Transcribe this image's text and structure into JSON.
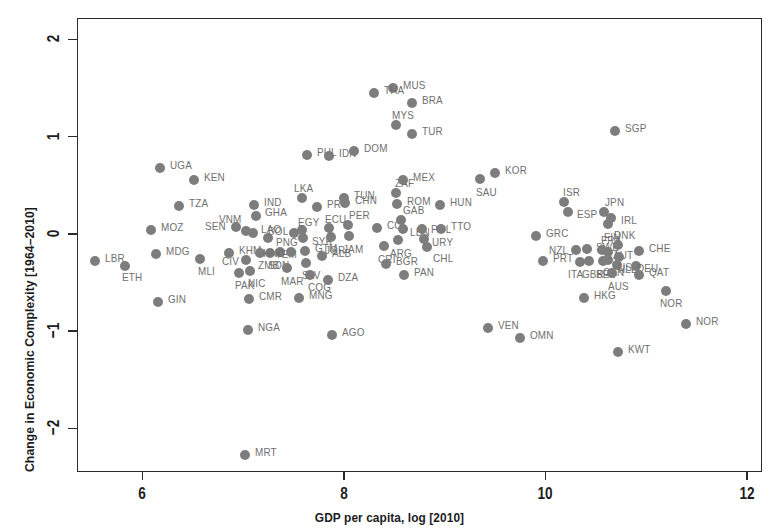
{
  "figure": {
    "background_color": "#ffffff",
    "point_color": "#7d7d7d",
    "label_color": "#6f6f6f",
    "axis_color": "#2a2a2a"
  },
  "chart_data": {
    "type": "scatter",
    "title": "",
    "subtitle": "",
    "xlabel": "GDP per capita, log [2010]",
    "ylabel": "Change in Economic Complexity [1964–2010]",
    "xlim": [
      5.35,
      12.15
    ],
    "ylim": [
      -2.45,
      2.22
    ],
    "xticks": [
      6,
      8,
      10,
      12
    ],
    "xtick_labels": [
      "6",
      "8",
      "10",
      "12"
    ],
    "yticks": [
      -2,
      -1,
      0,
      1,
      2
    ],
    "ytick_labels": [
      "−2",
      "−1",
      "0",
      "1",
      "2"
    ],
    "grid": false,
    "legend": false,
    "point_label_field": "iso3",
    "points": [
      {
        "iso3": "LBR",
        "x": 5.53,
        "y": -0.28,
        "lx": 10,
        "ly": -4
      },
      {
        "iso3": "ETH",
        "x": 5.83,
        "y": -0.33,
        "lx": -3,
        "ly": 10
      },
      {
        "iso3": "MOZ",
        "x": 6.08,
        "y": 0.04,
        "lx": 10,
        "ly": -4
      },
      {
        "iso3": "MDG",
        "x": 6.13,
        "y": -0.21,
        "lx": 10,
        "ly": -4
      },
      {
        "iso3": "UGA",
        "x": 6.17,
        "y": 0.68,
        "lx": 10,
        "ly": -4
      },
      {
        "iso3": "GIN",
        "x": 6.15,
        "y": -0.7,
        "lx": 10,
        "ly": -4
      },
      {
        "iso3": "TZA",
        "x": 6.36,
        "y": 0.29,
        "lx": 10,
        "ly": -4
      },
      {
        "iso3": "KEN",
        "x": 6.51,
        "y": 0.55,
        "lx": 10,
        "ly": -4
      },
      {
        "iso3": "MLI",
        "x": 6.57,
        "y": -0.26,
        "lx": -2,
        "ly": 11
      },
      {
        "iso3": "SEN",
        "x": 6.93,
        "y": 0.07,
        "lx": -31,
        "ly": -2
      },
      {
        "iso3": "KHM",
        "x": 6.86,
        "y": -0.2,
        "lx": 10,
        "ly": -4
      },
      {
        "iso3": "PAK",
        "x": 6.96,
        "y": -0.4,
        "lx": -4,
        "ly": 11
      },
      {
        "iso3": "VNM",
        "x": 7.03,
        "y": 0.03,
        "lx": -27,
        "ly": -13
      },
      {
        "iso3": "CIV",
        "x": 7.03,
        "y": -0.27,
        "lx": -24,
        "ly": 0
      },
      {
        "iso3": "NIC",
        "x": 7.07,
        "y": -0.38,
        "lx": -2,
        "ly": 11
      },
      {
        "iso3": "CMR",
        "x": 7.06,
        "y": -0.67,
        "lx": 10,
        "ly": -4
      },
      {
        "iso3": "MRT",
        "x": 7.02,
        "y": -2.27,
        "lx": 10,
        "ly": -4
      },
      {
        "iso3": "NGA",
        "x": 7.05,
        "y": -0.99,
        "lx": 10,
        "ly": -4
      },
      {
        "iso3": "IND",
        "x": 7.11,
        "y": 0.3,
        "lx": 10,
        "ly": -4
      },
      {
        "iso3": "GHA",
        "x": 7.13,
        "y": 0.18,
        "lx": 9,
        "ly": -5
      },
      {
        "iso3": "LAO",
        "x": 7.1,
        "y": 0.01,
        "lx": 8,
        "ly": -5
      },
      {
        "iso3": "ZMB",
        "x": 7.17,
        "y": -0.2,
        "lx": -2,
        "ly": 11
      },
      {
        "iso3": "SDN",
        "x": 7.27,
        "y": -0.2,
        "lx": -2,
        "ly": 11
      },
      {
        "iso3": "PNG",
        "x": 7.25,
        "y": -0.04,
        "lx": 8,
        "ly": 3
      },
      {
        "iso3": "YEM",
        "x": 7.37,
        "y": -0.19,
        "lx": -5,
        "ly": 1
      },
      {
        "iso3": "MAR",
        "x": 7.43,
        "y": -0.35,
        "lx": -6,
        "ly": 12
      },
      {
        "iso3": "BOL",
        "x": 7.5,
        "y": 0.01,
        "lx": -26,
        "ly": -3
      },
      {
        "iso3": "HND",
        "x": 7.47,
        "y": -0.19,
        "lx": -28,
        "ly": 0
      },
      {
        "iso3": "EGY",
        "x": 7.58,
        "y": 0.04,
        "lx": -4,
        "ly": -9
      },
      {
        "iso3": "SYR",
        "x": 7.59,
        "y": -0.04,
        "lx": 9,
        "ly": 2
      },
      {
        "iso3": "GTM",
        "x": 7.61,
        "y": -0.18,
        "lx": 10,
        "ly": -4
      },
      {
        "iso3": "SLV",
        "x": 7.62,
        "y": -0.3,
        "lx": -4,
        "ly": 11
      },
      {
        "iso3": "COG",
        "x": 7.66,
        "y": -0.42,
        "lx": -2,
        "ly": 11
      },
      {
        "iso3": "LKA",
        "x": 7.58,
        "y": 0.37,
        "lx": -8,
        "ly": -11
      },
      {
        "iso3": "PHL",
        "x": 7.63,
        "y": 0.81,
        "lx": 10,
        "ly": -4
      },
      {
        "iso3": "MNG",
        "x": 7.55,
        "y": -0.66,
        "lx": 10,
        "ly": -4
      },
      {
        "iso3": "PRY",
        "x": 7.73,
        "y": 0.28,
        "lx": 10,
        "ly": -4
      },
      {
        "iso3": "ALB",
        "x": 7.78,
        "y": -0.23,
        "lx": 10,
        "ly": -4
      },
      {
        "iso3": "IDN",
        "x": 7.85,
        "y": 0.8,
        "lx": 10,
        "ly": -4
      },
      {
        "iso3": "ECU",
        "x": 7.85,
        "y": 0.06,
        "lx": -4,
        "ly": -10
      },
      {
        "iso3": "JOR",
        "x": 7.87,
        "y": -0.03,
        "lx": -6,
        "ly": 12
      },
      {
        "iso3": "DZA",
        "x": 7.84,
        "y": -0.48,
        "lx": 10,
        "ly": -4
      },
      {
        "iso3": "AGO",
        "x": 7.88,
        "y": -1.04,
        "lx": 10,
        "ly": -4
      },
      {
        "iso3": "TUN",
        "x": 8.0,
        "y": 0.37,
        "lx": 10,
        "ly": -4
      },
      {
        "iso3": "CHN",
        "x": 8.01,
        "y": 0.32,
        "lx": 10,
        "ly": -4
      },
      {
        "iso3": "PER",
        "x": 8.04,
        "y": 0.09,
        "lx": 1,
        "ly": -11
      },
      {
        "iso3": "JAM",
        "x": 8.05,
        "y": -0.02,
        "lx": -6,
        "ly": 12
      },
      {
        "iso3": "DOM",
        "x": 8.1,
        "y": 0.85,
        "lx": 10,
        "ly": -4
      },
      {
        "iso3": "COL",
        "x": 8.33,
        "y": 0.06,
        "lx": 10,
        "ly": -4
      },
      {
        "iso3": "CRI",
        "x": 8.4,
        "y": -0.13,
        "lx": -6,
        "ly": 12
      },
      {
        "iso3": "BGR",
        "x": 8.42,
        "y": -0.31,
        "lx": 10,
        "ly": -4
      },
      {
        "iso3": "ZAF",
        "x": 8.52,
        "y": 0.42,
        "lx": -1,
        "ly": -11
      },
      {
        "iso3": "ROM",
        "x": 8.53,
        "y": 0.31,
        "lx": 10,
        "ly": -4
      },
      {
        "iso3": "GAB",
        "x": 8.57,
        "y": 0.14,
        "lx": 2,
        "ly": -11
      },
      {
        "iso3": "LBN",
        "x": 8.59,
        "y": 0.05,
        "lx": 7,
        "ly": 2
      },
      {
        "iso3": "ARG",
        "x": 8.54,
        "y": -0.06,
        "lx": -8,
        "ly": 12
      },
      {
        "iso3": "MEX",
        "x": 8.59,
        "y": 0.55,
        "lx": 10,
        "ly": -4
      },
      {
        "iso3": "MUS",
        "x": 8.49,
        "y": 1.5,
        "lx": 10,
        "ly": -4
      },
      {
        "iso3": "MYS",
        "x": 8.52,
        "y": 1.12,
        "lx": -4,
        "ly": -11
      },
      {
        "iso3": "BRA",
        "x": 8.68,
        "y": 1.35,
        "lx": 10,
        "ly": -4
      },
      {
        "iso3": "THA",
        "x": 8.3,
        "y": 1.45,
        "lx": 10,
        "ly": -4
      },
      {
        "iso3": "TUR",
        "x": 8.68,
        "y": 1.03,
        "lx": 10,
        "ly": -4
      },
      {
        "iso3": "PAN",
        "x": 8.6,
        "y": -0.42,
        "lx": 10,
        "ly": -4
      },
      {
        "iso3": "POL",
        "x": 8.77,
        "y": 0.05,
        "lx": 9,
        "ly": -1
      },
      {
        "iso3": "URY",
        "x": 8.79,
        "y": -0.05,
        "lx": 8,
        "ly": 2
      },
      {
        "iso3": "CHL",
        "x": 8.82,
        "y": -0.14,
        "lx": 6,
        "ly": 10
      },
      {
        "iso3": "HUN",
        "x": 8.95,
        "y": 0.3,
        "lx": 10,
        "ly": -4
      },
      {
        "iso3": "TTO",
        "x": 8.96,
        "y": 0.05,
        "lx": 10,
        "ly": -4
      },
      {
        "iso3": "SAU",
        "x": 9.35,
        "y": 0.56,
        "lx": -4,
        "ly": 12
      },
      {
        "iso3": "KOR",
        "x": 9.5,
        "y": 0.63,
        "lx": 10,
        "ly": -4
      },
      {
        "iso3": "VEN",
        "x": 9.43,
        "y": -0.97,
        "lx": 10,
        "ly": -4
      },
      {
        "iso3": "GRC",
        "x": 9.91,
        "y": -0.02,
        "lx": 10,
        "ly": -4
      },
      {
        "iso3": "OMN",
        "x": 9.75,
        "y": -1.07,
        "lx": 10,
        "ly": -4
      },
      {
        "iso3": "PRT",
        "x": 9.98,
        "y": -0.28,
        "lx": 10,
        "ly": -4
      },
      {
        "iso3": "ISR",
        "x": 10.18,
        "y": 0.33,
        "lx": -1,
        "ly": -11
      },
      {
        "iso3": "ESP",
        "x": 10.22,
        "y": 0.22,
        "lx": 9,
        "ly": 1
      },
      {
        "iso3": "NZL",
        "x": 10.3,
        "y": -0.17,
        "lx": -27,
        "ly": -1
      },
      {
        "iso3": "ITA",
        "x": 10.34,
        "y": -0.29,
        "lx": -12,
        "ly": 11
      },
      {
        "iso3": "SWE",
        "x": 10.41,
        "y": -0.16,
        "lx": 9,
        "ly": -3
      },
      {
        "iso3": "GBR",
        "x": 10.43,
        "y": -0.28,
        "lx": -7,
        "ly": 12
      },
      {
        "iso3": "HKG",
        "x": 10.38,
        "y": -0.66,
        "lx": 10,
        "ly": -4
      },
      {
        "iso3": "JPN",
        "x": 10.58,
        "y": 0.22,
        "lx": 1,
        "ly": -11
      },
      {
        "iso3": "FIN",
        "x": 10.62,
        "y": 0.1,
        "lx": -4,
        "ly": 12
      },
      {
        "iso3": "IRL",
        "x": 10.65,
        "y": 0.16,
        "lx": 10,
        "ly": 1
      },
      {
        "iso3": "SGP",
        "x": 10.69,
        "y": 1.06,
        "lx": 10,
        "ly": -4
      },
      {
        "iso3": "FRA",
        "x": 10.56,
        "y": -0.17,
        "lx": -1,
        "ly": -11
      },
      {
        "iso3": "BEL",
        "x": 10.57,
        "y": -0.28,
        "lx": -7,
        "ly": 12
      },
      {
        "iso3": "AUT",
        "x": 10.62,
        "y": -0.19,
        "lx": 5,
        "ly": 2
      },
      {
        "iso3": "CAN",
        "x": 10.62,
        "y": -0.27,
        "lx": -5,
        "ly": 11
      },
      {
        "iso3": "DNK",
        "x": 10.72,
        "y": -0.12,
        "lx": -4,
        "ly": -11
      },
      {
        "iso3": "NLD",
        "x": 10.73,
        "y": -0.24,
        "lx": -1,
        "ly": 11
      },
      {
        "iso3": "AUS",
        "x": 10.66,
        "y": -0.4,
        "lx": -4,
        "ly": 12
      },
      {
        "iso3": "USA",
        "x": 10.71,
        "y": -0.32,
        "lx": 1,
        "ly": 1
      },
      {
        "iso3": "KWT",
        "x": 10.72,
        "y": -1.22,
        "lx": 10,
        "ly": -4
      },
      {
        "iso3": "DEU",
        "x": 10.9,
        "y": -0.33,
        "lx": 1,
        "ly": 1
      },
      {
        "iso3": "CHE",
        "x": 10.93,
        "y": -0.18,
        "lx": 10,
        "ly": -4
      },
      {
        "iso3": "QAT",
        "x": 10.93,
        "y": -0.42,
        "lx": 10,
        "ly": -4
      },
      {
        "iso3": "NOR",
        "x": 11.2,
        "y": -0.59,
        "lx": -6,
        "ly": 11
      },
      {
        "iso3": "NOR2",
        "x": 11.4,
        "y": -0.93,
        "lx": 10,
        "ly": -4
      }
    ]
  }
}
